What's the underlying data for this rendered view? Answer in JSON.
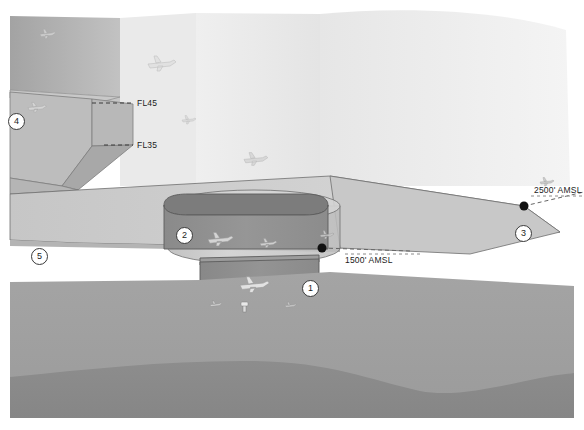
{
  "diagram": {
    "type": "3d-airspace-schematic",
    "background_color": "#ffffff"
  },
  "altitude_labels": [
    {
      "id": "fl45",
      "text": "FL45",
      "x": 137,
      "y": 103
    },
    {
      "id": "fl35",
      "text": "FL35",
      "x": 137,
      "y": 145
    },
    {
      "id": "amsl2500",
      "text": "2500' AMSL",
      "x": 536,
      "y": 189
    },
    {
      "id": "amsl1500",
      "text": "1500' AMSL",
      "x": 345,
      "y": 259
    }
  ],
  "callouts": [
    {
      "id": "c1",
      "text": "1",
      "x": 302,
      "y": 280
    },
    {
      "id": "c2",
      "text": "2",
      "x": 176,
      "y": 227
    },
    {
      "id": "c3",
      "text": "3",
      "x": 515,
      "y": 225
    },
    {
      "id": "c4",
      "text": "4",
      "x": 8,
      "y": 113
    },
    {
      "id": "c5",
      "text": "5",
      "x": 31,
      "y": 248
    }
  ],
  "colors": {
    "sky_block_light": "#e7e7e7",
    "sky_block_lighter": "#efefef",
    "sky_block_mid": "#dcdcdc",
    "left_block_dark": "#a9a9a9",
    "left_block_mid": "#b6b6b6",
    "left_block_light": "#c4c4c4",
    "shelf_top": "#cfcfcf",
    "shelf_face": "#b3b3b3",
    "cylinder_body": "#c6c6c6",
    "cylinder_top": "#d0d0d0",
    "inner_box": "#8e8e8e",
    "inner_box_top": "#7e7e7e",
    "lower_box": "#8c8c8c",
    "lower_box_top": "#9a9a9a",
    "ground_upper": "#9d9d9d",
    "ground_lower": "#8a8a8a",
    "outline": "#4a4a4a",
    "text": "#1b1b1b"
  },
  "aircraft": [
    {
      "id": "a1",
      "x": 40,
      "y": 32,
      "w": 14,
      "scale": 0.8,
      "tone": "#cfcfcf"
    },
    {
      "id": "a2",
      "x": 152,
      "y": 62,
      "w": 24,
      "scale": 1.0,
      "tone": "#d8d8d8"
    },
    {
      "id": "a3",
      "x": 182,
      "y": 120,
      "w": 10,
      "scale": 0.7,
      "tone": "#cdcdcd"
    },
    {
      "id": "a4",
      "x": 247,
      "y": 158,
      "w": 22,
      "scale": 0.9,
      "tone": "#c9c9c9"
    },
    {
      "id": "a5",
      "x": 542,
      "y": 182,
      "w": 12,
      "scale": 0.7,
      "tone": "#b9b9b9"
    },
    {
      "id": "a6",
      "x": 30,
      "y": 107,
      "w": 16,
      "scale": 0.9,
      "tone": "#cccccc"
    },
    {
      "id": "a7",
      "x": 213,
      "y": 238,
      "w": 22,
      "scale": 0.9,
      "tone": "#d9d9d9"
    },
    {
      "id": "a8",
      "x": 264,
      "y": 243,
      "w": 14,
      "scale": 0.8,
      "tone": "#d4d4d4"
    },
    {
      "id": "a9",
      "x": 323,
      "y": 235,
      "w": 10,
      "scale": 0.7,
      "tone": "#cfcfcf"
    },
    {
      "id": "a10",
      "x": 249,
      "y": 285,
      "w": 28,
      "scale": 1.0,
      "tone": "#e2e2e2"
    }
  ],
  "markers": [
    {
      "id": "m1",
      "label": "1500ft-node",
      "x": 322,
      "y": 248,
      "r": 4
    },
    {
      "id": "m2",
      "label": "2500ft-node",
      "x": 524,
      "y": 206,
      "r": 4
    }
  ],
  "leader_lines": [
    {
      "id": "l-fl45",
      "from_x": 92,
      "from_y": 103,
      "to_x": 133,
      "to_y": 103,
      "dashed": true
    },
    {
      "id": "l-fl35",
      "from_x": 105,
      "from_y": 145,
      "to_x": 133,
      "to_y": 145,
      "dashed": true
    },
    {
      "id": "l-1500",
      "from_x": 322,
      "from_y": 248,
      "to_x": 408,
      "to_y": 250,
      "dashed": true
    },
    {
      "id": "l-2500",
      "from_x": 524,
      "from_y": 206,
      "to_x": 584,
      "to_y": 193,
      "dashed": true
    }
  ]
}
